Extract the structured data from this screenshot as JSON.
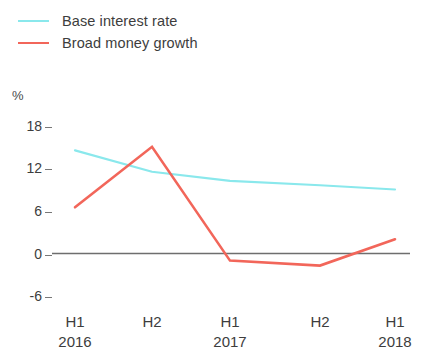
{
  "chart_data": {
    "type": "line",
    "title": "",
    "subtitle": "",
    "xlabel": "",
    "ylabel": "%",
    "unit_label": "%",
    "categories": [
      "H1 2016",
      "H2 2016",
      "H1 2017",
      "H2 2017",
      "H1 2018"
    ],
    "x_tick_periods": [
      "H1",
      "H2",
      "H1",
      "H2",
      "H1"
    ],
    "x_tick_years": [
      "2016",
      "",
      "2017",
      "",
      "2018"
    ],
    "y_ticks": [
      18,
      12,
      6,
      0,
      -6
    ],
    "y_tick_labels": [
      "18",
      "12",
      "6",
      "0",
      "-6"
    ],
    "ylim": [
      -7.5,
      19.5
    ],
    "grid": false,
    "zero_line": true,
    "legend_position": "top-left",
    "series": [
      {
        "name": "Base interest rate",
        "color": "#8ae8ec",
        "values": [
          14.5,
          11.5,
          10.2,
          9.6,
          9.0
        ]
      },
      {
        "name": "Broad money growth",
        "color": "#f2665a",
        "values": [
          6.5,
          15.0,
          -1.0,
          -1.7,
          2.0
        ]
      }
    ]
  },
  "legend": {
    "items": [
      {
        "label": "Base interest rate",
        "color": "#8ae8ec"
      },
      {
        "label": "Broad money growth",
        "color": "#f2665a"
      }
    ]
  },
  "colors": {
    "base_interest_rate": "#8ae8ec",
    "broad_money_growth": "#f2665a",
    "zero_axis": "#6e6e6e",
    "tick": "#777777",
    "text": "#3d3d3d",
    "background": "#ffffff"
  }
}
